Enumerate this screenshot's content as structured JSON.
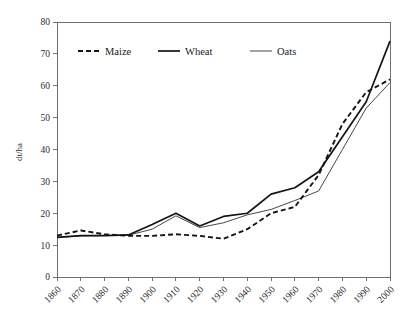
{
  "chart_data": {
    "type": "line",
    "title": "",
    "xlabel": "",
    "ylabel": "dt/ha",
    "categories": [
      "1860",
      "1870",
      "1880",
      "1890",
      "1900",
      "1910",
      "1920",
      "1930",
      "1940",
      "1950",
      "1960",
      "1970",
      "1980",
      "1990",
      "2000"
    ],
    "x": [
      1860,
      1870,
      1880,
      1890,
      1900,
      1910,
      1920,
      1930,
      1940,
      1950,
      1960,
      1970,
      1980,
      1990,
      2000
    ],
    "xlim": [
      1860,
      2000
    ],
    "ylim": [
      0,
      80
    ],
    "yticks": [
      0,
      10,
      20,
      30,
      40,
      50,
      60,
      70,
      80
    ],
    "ytick_labels": [
      "0",
      "10",
      "20",
      "30",
      "40",
      "50",
      "60",
      "70",
      "80"
    ],
    "grid": false,
    "legend_position": "top-inside",
    "series": [
      {
        "name": "Maize",
        "style": "dashed",
        "values": [
          13.0,
          14.6,
          13.4,
          12.9,
          12.9,
          13.4,
          12.9,
          12.0,
          15.0,
          20.0,
          22.0,
          32.0,
          48.0,
          58.0,
          62.0
        ]
      },
      {
        "name": "Wheat",
        "style": "solid-thick",
        "values": [
          12.4,
          13.0,
          13.0,
          13.2,
          16.5,
          20.0,
          16.0,
          19.0,
          20.0,
          26.0,
          28.0,
          33.0,
          44.0,
          55.0,
          74.0
        ]
      },
      {
        "name": "Oats",
        "style": "solid-thin",
        "values": [
          12.4,
          12.9,
          13.0,
          13.1,
          15.0,
          19.2,
          15.5,
          17.0,
          19.5,
          21.2,
          24.0,
          27.0,
          40.0,
          53.0,
          61.0
        ]
      }
    ]
  },
  "axes": {
    "y_axis_title": "dt/ha"
  },
  "legend": {
    "entries": [
      {
        "label": "Maize"
      },
      {
        "label": "Wheat"
      },
      {
        "label": "Oats"
      }
    ]
  }
}
